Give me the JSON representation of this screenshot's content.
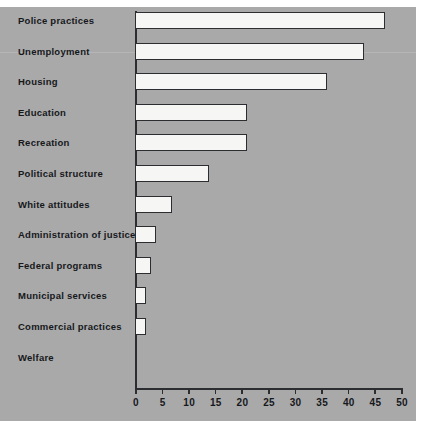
{
  "chart_data": {
    "type": "bar",
    "orientation": "horizontal",
    "title": "",
    "xlabel": "",
    "ylabel": "",
    "xlim": [
      0,
      50
    ],
    "xticks": [
      0,
      5,
      10,
      15,
      20,
      25,
      30,
      35,
      40,
      45,
      50
    ],
    "grid": false,
    "legend": null,
    "categories": [
      "Police practices",
      "Unemployment",
      "Housing",
      "Education",
      "Recreation",
      "Political structure",
      "White attitudes",
      "Administration of justice",
      "Federal programs",
      "Municipal services",
      "Commercial practices",
      "Welfare"
    ],
    "values": [
      47,
      43,
      36,
      21,
      21,
      14,
      7,
      4,
      3,
      2,
      2,
      0
    ],
    "bar_fill_color": "#f6f6f4",
    "bar_edge_color": "#2b2d30",
    "background_color": "#a9a9a9"
  }
}
